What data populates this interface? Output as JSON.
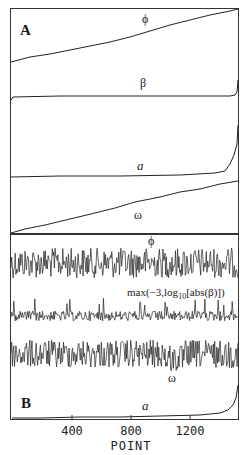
{
  "figure": {
    "panels": [
      {
        "id": "A",
        "label": "A",
        "traces": [
          {
            "name": "phi",
            "label": "ϕ",
            "shape": "linear ramp rising left to right"
          },
          {
            "name": "beta",
            "label": "β",
            "shape": "flat with sharp rise at right edge"
          },
          {
            "name": "a",
            "label": "a",
            "shape": "flat then sharp rise near point ~1450-1540"
          },
          {
            "name": "omega",
            "label": "ω",
            "shape": "linear ramp rising left to right"
          }
        ]
      },
      {
        "id": "B",
        "label": "B",
        "traces": [
          {
            "name": "phi",
            "label": "ϕ",
            "shape": "high-frequency noise"
          },
          {
            "name": "log_beta",
            "label_prefix": "max(−3,log",
            "label_sub": "10",
            "label_suffix": "[abs(β)])",
            "shape": "noise with upward spikes"
          },
          {
            "name": "omega",
            "label": "ω",
            "shape": "high-frequency noise"
          },
          {
            "name": "a",
            "label": "a",
            "shape": "flat then sharp rise at right edge"
          }
        ]
      }
    ],
    "x_axis": {
      "title": "POINT",
      "ticks": [
        {
          "value": 400,
          "label": "400"
        },
        {
          "value": 800,
          "label": "800"
        },
        {
          "value": 1200,
          "label": "1200"
        }
      ],
      "range": [
        0,
        1540
      ]
    }
  },
  "chart_data": {
    "type": "line",
    "title": "",
    "xlabel": "POINT",
    "ylabel": "",
    "xlim": [
      0,
      1540
    ],
    "xticks": [
      400,
      800,
      1200
    ],
    "grid": false,
    "panels": [
      {
        "panel": "A",
        "series": [
          {
            "name": "ϕ",
            "x": [
              0,
              400,
              800,
              1200,
              1540
            ],
            "y_norm": [
              0.0,
              0.27,
              0.52,
              0.78,
              1.0
            ]
          },
          {
            "name": "β",
            "x": [
              0,
              400,
              800,
              1200,
              1500,
              1540
            ],
            "y_norm": [
              0.0,
              0.0,
              0.0,
              0.0,
              0.01,
              0.2
            ]
          },
          {
            "name": "a",
            "x": [
              0,
              400,
              800,
              1200,
              1400,
              1470,
              1520,
              1540
            ],
            "y_norm": [
              0.0,
              0.01,
              0.01,
              0.02,
              0.05,
              0.15,
              0.4,
              1.0
            ]
          },
          {
            "name": "ω",
            "x": [
              0,
              400,
              800,
              1200,
              1540
            ],
            "y_norm": [
              0.0,
              0.3,
              0.55,
              0.8,
              1.0
            ]
          }
        ]
      },
      {
        "panel": "B",
        "series": [
          {
            "name": "ϕ",
            "description": "random noise, uniform amplitude across all points"
          },
          {
            "name": "max(−3,log10[abs(β)])",
            "description": "noise baseline near −3 with sparse upward spikes"
          },
          {
            "name": "ω",
            "description": "random noise, uniform amplitude, slight dip near point ~1050"
          },
          {
            "name": "a",
            "x": [
              0,
              400,
              800,
              1200,
              1400,
              1500,
              1540
            ],
            "y_norm": [
              0.0,
              0.01,
              0.02,
              0.04,
              0.1,
              0.3,
              1.0
            ]
          }
        ]
      }
    ]
  }
}
